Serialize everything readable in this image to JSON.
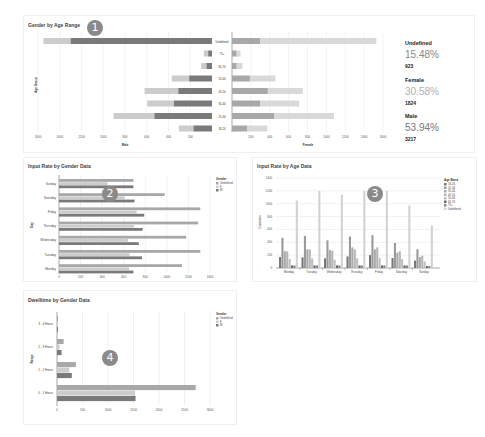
{
  "markers": [
    "1",
    "2",
    "3",
    "4"
  ],
  "panel1": {
    "title": "Gender by Age Range",
    "stats": [
      {
        "label": "Undefined",
        "percent": "15.48%",
        "count": "923",
        "color": "#888888"
      },
      {
        "label": "Female",
        "percent": "30.58%",
        "count": "1824",
        "color": "#b0b0b0"
      },
      {
        "label": "Male",
        "percent": "53.94%",
        "count": "3217",
        "color": "#777777"
      }
    ]
  },
  "panel2": {
    "title": "Input Rate by Gender Data"
  },
  "panel3": {
    "title": "Input Rate by Age Data"
  },
  "panel4": {
    "title": "Dwelltime by Gender Data"
  },
  "colors": {
    "dark": "#7a7a7a",
    "mid": "#a8a8a8",
    "light": "#cccccc",
    "lighter": "#d9d9d9"
  },
  "chart_data": [
    {
      "type": "bar",
      "title": "Gender by Age Range",
      "orientation": "horizontal-butterfly",
      "categories": [
        "Undefined",
        "75+",
        "65-74",
        "55-64",
        "45-54",
        "35-44",
        "25-34",
        "18-24"
      ],
      "ylabel": "Age Group",
      "left": {
        "xlabel": "Male",
        "ticks": [
          1600,
          1400,
          1200,
          1000,
          800,
          600,
          400,
          200
        ],
        "series": [
          {
            "name": "Male (dark)",
            "values": [
              1300,
              35,
              50,
              210,
              310,
              350,
              530,
              170
            ]
          },
          {
            "name": "Male (light)",
            "values": [
              250,
              40,
              50,
              160,
              310,
              245,
              375,
              135
            ]
          }
        ]
      },
      "right": {
        "xlabel": "Female",
        "ticks": [
          200,
          400,
          600,
          800,
          1000,
          1200,
          1400,
          1600
        ],
        "series": [
          {
            "name": "Female (dark)",
            "values": [
              300,
              50,
              50,
              190,
              380,
              300,
              450,
              160
            ]
          },
          {
            "name": "Female (light)",
            "values": [
              1230,
              40,
              60,
              270,
              370,
              410,
              630,
              215
            ]
          }
        ]
      },
      "xlim": [
        0,
        1600
      ]
    },
    {
      "type": "bar",
      "title": "Input Rate by Gender Data",
      "orientation": "horizontal",
      "categories": [
        "Sunday",
        "Saturday",
        "Friday",
        "Thursday",
        "Wednesday",
        "Tuesday",
        "Monday"
      ],
      "ylabel": "Day",
      "xticks": [
        0,
        200,
        400,
        600,
        800,
        1000,
        1200,
        1400
      ],
      "xlim": [
        0,
        1400
      ],
      "legend_title": "Gender",
      "series": [
        {
          "name": "Undefined",
          "values": [
            690,
            980,
            1310,
            1290,
            1180,
            1310,
            1140
          ]
        },
        {
          "name": "F",
          "values": [
            450,
            610,
            720,
            695,
            640,
            655,
            650
          ]
        },
        {
          "name": "M",
          "values": [
            690,
            700,
            790,
            775,
            740,
            770,
            690
          ]
        }
      ],
      "grid": true,
      "legend_position": "right"
    },
    {
      "type": "bar",
      "title": "Input Rate by Age Data",
      "orientation": "vertical",
      "categories": [
        "Monday",
        "Tuesday",
        "Wednesday",
        "Thursday",
        "Friday",
        "Saturday",
        "Sunday"
      ],
      "ylabel": "Customers",
      "yticks": [
        0,
        200,
        400,
        600,
        800,
        1000,
        1200,
        1400
      ],
      "ylim": [
        0,
        1400
      ],
      "legend_title": "Age Band",
      "series": [
        {
          "name": "18-24",
          "values": [
            170,
            165,
            150,
            180,
            200,
            155,
            115
          ]
        },
        {
          "name": "25-34",
          "values": [
            470,
            500,
            430,
            490,
            510,
            390,
            290
          ]
        },
        {
          "name": "35-44",
          "values": [
            260,
            290,
            280,
            320,
            290,
            240,
            170
          ]
        },
        {
          "name": "45-54",
          "values": [
            260,
            290,
            270,
            290,
            320,
            260,
            190
          ]
        },
        {
          "name": "55-64",
          "values": [
            140,
            150,
            130,
            150,
            150,
            140,
            100
          ]
        },
        {
          "name": "65-74",
          "values": [
            40,
            40,
            40,
            40,
            40,
            40,
            30
          ]
        },
        {
          "name": "75+",
          "values": [
            40,
            40,
            40,
            40,
            40,
            40,
            30
          ]
        },
        {
          "name": "Undefined",
          "values": [
            1050,
            1200,
            1140,
            1200,
            1200,
            970,
            660
          ]
        }
      ],
      "grid": true,
      "legend_position": "right"
    },
    {
      "type": "bar",
      "title": "Dwelltime by Gender Data",
      "orientation": "horizontal",
      "categories": [
        "3 - 4 Hours",
        "2 - 3 Hours",
        "1 - 2 Hours",
        "0 - 1 Hours"
      ],
      "ylabel": "Range",
      "xticks": [
        0,
        500,
        1000,
        1500,
        2000,
        2500,
        3000
      ],
      "xlim": [
        0,
        3000
      ],
      "legend_title": "Gender",
      "series": [
        {
          "name": "Undefined",
          "values": [
            20,
            130,
            370,
            2720
          ]
        },
        {
          "name": "F",
          "values": [
            15,
            50,
            240,
            1530
          ]
        },
        {
          "name": "M",
          "values": [
            20,
            90,
            290,
            1540
          ]
        }
      ],
      "grid": true,
      "legend_position": "right"
    }
  ]
}
